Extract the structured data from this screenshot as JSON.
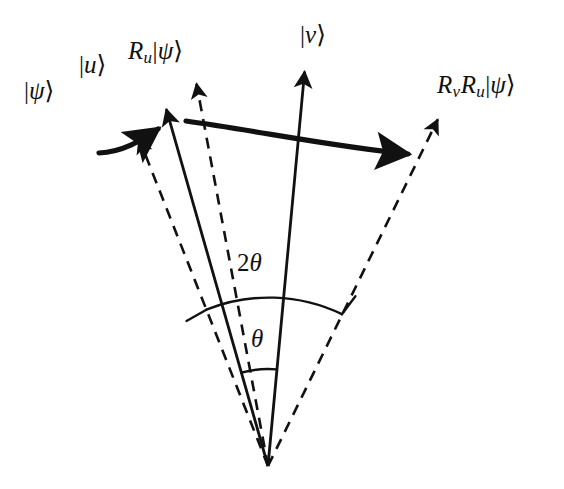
{
  "figure": {
    "kind": "vector-rotation-diagram",
    "background_color": "#ffffff",
    "stroke_color": "#111111",
    "canvas": {
      "width": 564,
      "height": 489
    },
    "origin": {
      "x": 268,
      "y": 466
    }
  },
  "labels": {
    "psi": {
      "operators": "",
      "ket": "ψ"
    },
    "u": {
      "operators": "",
      "ket": "u"
    },
    "ru_psi": {
      "op1": "R",
      "sub1": "u",
      "ket": "ψ"
    },
    "v": {
      "operators": "",
      "ket": "v"
    },
    "rvru_psi": {
      "op1": "R",
      "sub1": "v",
      "op2": "R",
      "sub2": "u",
      "ket": "ψ"
    },
    "ket_bar": "|",
    "ket_close": "⟩"
  },
  "angles": {
    "two_theta": {
      "coefficient": "2",
      "symbol": "θ"
    },
    "theta": {
      "coefficient": "",
      "symbol": "θ"
    }
  },
  "rays": [
    {
      "name": "psi",
      "label_key": "psi",
      "style": "dashed",
      "angle_deg_from_vertical": -21.5,
      "length": 352,
      "arrow": true
    },
    {
      "name": "u",
      "label_key": "u",
      "style": "solid",
      "angle_deg_from_vertical": -15.9,
      "length": 371,
      "arrow": true
    },
    {
      "name": "ru_psi",
      "label_key": "ru_psi",
      "style": "dashed",
      "angle_deg_from_vertical": -10.6,
      "length": 389,
      "arrow": true
    },
    {
      "name": "v",
      "label_key": "v",
      "style": "solid",
      "angle_deg_from_vertical": 5.3,
      "length": 396,
      "arrow": true
    },
    {
      "name": "rvru_psi",
      "label_key": "rvru_psi",
      "style": "dashed",
      "angle_deg_from_vertical": 26.1,
      "length": 386,
      "arrow": true
    }
  ],
  "arcs": [
    {
      "name": "theta-arc",
      "radius": 97,
      "from_ray": "u",
      "to_ray": "v",
      "label": "theta"
    },
    {
      "name": "two-theta-arc",
      "radius": 168,
      "from_ray": "psi",
      "to_ray": "rvru_psi",
      "label": "two_theta"
    }
  ],
  "rotation_arrows": [
    {
      "name": "first-rotation-arrow",
      "from_ray": "psi",
      "to_ray": "ru_psi",
      "meaning": "reflection about |u>"
    },
    {
      "name": "second-rotation-arrow",
      "from_ray": "ru_psi",
      "to_ray": "rvru_psi",
      "meaning": "reflection about |v>"
    }
  ],
  "colors": {
    "stroke": "#111111",
    "background": "#ffffff"
  }
}
